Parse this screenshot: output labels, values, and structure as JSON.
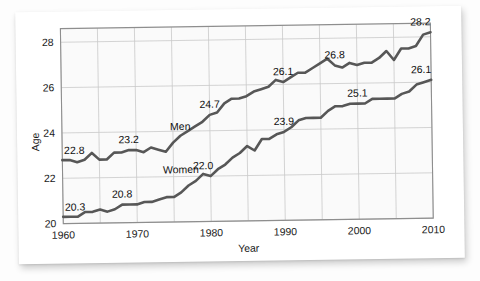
{
  "figure": {
    "background_color": "#ffffff",
    "plot_background_color": "#fafafa",
    "line_color": "#575757",
    "grid_color": "#c9c9c9",
    "axis_color": "#8e8e8e"
  },
  "chart_data": {
    "type": "line",
    "title": "",
    "xlabel": "Year",
    "ylabel": "Age",
    "xlim": [
      1960,
      2010
    ],
    "ylim": [
      20,
      28.6
    ],
    "xticks": [
      1960,
      1970,
      1980,
      1990,
      2000,
      2010
    ],
    "yticks": [
      20,
      22,
      24,
      26,
      28
    ],
    "xtick_labels": [
      "1960",
      "1970",
      "1980",
      "1990",
      "2000",
      "2010"
    ],
    "ytick_labels": [
      "20",
      "22",
      "24",
      "26",
      "28"
    ],
    "grid": true,
    "legend": "inline-series-labels",
    "series": [
      {
        "name": "Men",
        "label_x": 1976,
        "label_y": 24.05,
        "x": [
          1960,
          1961,
          1962,
          1963,
          1964,
          1965,
          1966,
          1967,
          1968,
          1969,
          1970,
          1971,
          1972,
          1973,
          1974,
          1975,
          1976,
          1977,
          1978,
          1979,
          1980,
          1981,
          1982,
          1983,
          1984,
          1985,
          1986,
          1987,
          1988,
          1989,
          1990,
          1991,
          1992,
          1993,
          1994,
          1995,
          1996,
          1997,
          1998,
          1999,
          2000,
          2001,
          2002,
          2003,
          2004,
          2005,
          2006,
          2007,
          2008,
          2009,
          2010
        ],
        "y": [
          22.8,
          22.8,
          22.7,
          22.8,
          23.1,
          22.8,
          22.8,
          23.1,
          23.1,
          23.2,
          23.2,
          23.1,
          23.3,
          23.2,
          23.1,
          23.5,
          23.8,
          24.0,
          24.2,
          24.4,
          24.7,
          24.8,
          25.2,
          25.4,
          25.4,
          25.5,
          25.7,
          25.8,
          25.9,
          26.2,
          26.1,
          26.3,
          26.5,
          26.5,
          26.7,
          26.9,
          27.1,
          26.8,
          26.7,
          26.9,
          26.8,
          26.9,
          26.9,
          27.1,
          27.4,
          27.0,
          27.5,
          27.5,
          27.6,
          28.1,
          28.2
        ],
        "annotations": [
          {
            "x": 1960,
            "y": 22.8,
            "text": "22.8"
          },
          {
            "x": 1969,
            "y": 23.2,
            "text": "23.2"
          },
          {
            "x": 1980,
            "y": 24.7,
            "text": "24.7"
          },
          {
            "x": 1990,
            "y": 26.1,
            "text": "26.1"
          },
          {
            "x": 1997,
            "y": 26.8,
            "text": "26.8"
          },
          {
            "x": 2010,
            "y": 28.2,
            "text": "28.2"
          }
        ]
      },
      {
        "name": "Women",
        "label_x": 1976,
        "label_y": 22.15,
        "x": [
          1960,
          1961,
          1962,
          1963,
          1964,
          1965,
          1966,
          1967,
          1968,
          1969,
          1970,
          1971,
          1972,
          1973,
          1974,
          1975,
          1976,
          1977,
          1978,
          1979,
          1980,
          1981,
          1982,
          1983,
          1984,
          1985,
          1986,
          1987,
          1988,
          1989,
          1990,
          1991,
          1992,
          1993,
          1994,
          1995,
          1996,
          1997,
          1998,
          1999,
          2000,
          2001,
          2002,
          2003,
          2004,
          2005,
          2006,
          2007,
          2008,
          2009,
          2010
        ],
        "y": [
          20.3,
          20.3,
          20.3,
          20.5,
          20.5,
          20.6,
          20.5,
          20.6,
          20.8,
          20.8,
          20.8,
          20.9,
          20.9,
          21.0,
          21.1,
          21.1,
          21.3,
          21.6,
          21.8,
          22.1,
          22.0,
          22.3,
          22.5,
          22.8,
          23.0,
          23.3,
          23.1,
          23.6,
          23.6,
          23.8,
          23.9,
          24.1,
          24.4,
          24.5,
          24.5,
          24.5,
          24.8,
          25.0,
          25.0,
          25.1,
          25.1,
          25.1,
          25.3,
          25.3,
          25.3,
          25.3,
          25.5,
          25.6,
          25.9,
          26.0,
          26.1
        ],
        "annotations": [
          {
            "x": 1960,
            "y": 20.3,
            "text": "20.3"
          },
          {
            "x": 1968,
            "y": 20.8,
            "text": "20.8"
          },
          {
            "x": 1979,
            "y": 22.0,
            "text": "22.0"
          },
          {
            "x": 1990,
            "y": 23.9,
            "text": "23.9"
          },
          {
            "x": 2000,
            "y": 25.1,
            "text": "25.1"
          },
          {
            "x": 2010,
            "y": 26.1,
            "text": "26.1"
          }
        ]
      }
    ]
  }
}
